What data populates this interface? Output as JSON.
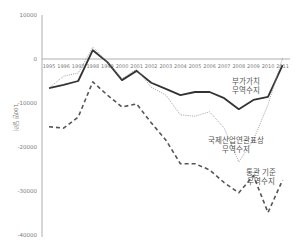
{
  "chart_data": {
    "type": "line",
    "title": "",
    "xlabel": "",
    "ylabel": "100만 달러",
    "ylim": [
      -40000,
      10000
    ],
    "yticks": [
      10000,
      0,
      -10000,
      -20000,
      -30000,
      -40000
    ],
    "ytick_labels": [
      "10000",
      "0",
      "-10000",
      "-20000",
      "-30000",
      "-40000"
    ],
    "grid": false,
    "legend_position": "inline-annotations",
    "categories": [
      "1995",
      "1996",
      "1997",
      "1998",
      "1999",
      "2000",
      "2001",
      "2002",
      "2003",
      "2004",
      "2005",
      "2006",
      "2007",
      "2008",
      "2009",
      "2010",
      "2011"
    ],
    "series": [
      {
        "name": "부가가치 무역수지",
        "label_lines": [
          "부가가치",
          "무역수지"
        ],
        "style": "solid",
        "color": "#333333",
        "values": [
          -6600,
          -5900,
          -5000,
          2000,
          -700,
          -4800,
          -2700,
          -5400,
          -6800,
          -8200,
          -7500,
          -7500,
          -8900,
          -11400,
          -9300,
          -8600,
          -1400
        ]
      },
      {
        "name": "국제산업연관표상 무역수지",
        "label_lines": [
          "국제산업연관표상",
          "무역수지"
        ],
        "style": "dotted",
        "color": "#888888",
        "values": [
          -6600,
          -3900,
          -3200,
          2700,
          -700,
          -4500,
          -2300,
          -6400,
          -8200,
          -12700,
          -13000,
          -12000,
          -15700,
          -23400,
          -18400,
          -10400,
          200
        ]
      },
      {
        "name": "통관 기준 무역수지",
        "label_lines": [
          "통관 기준",
          "무역수지"
        ],
        "style": "dashed",
        "color": "#555555",
        "values": [
          -15400,
          -15700,
          -13200,
          -5200,
          -8200,
          -10900,
          -10200,
          -14500,
          -18400,
          -23800,
          -23800,
          -25200,
          -28100,
          -30400,
          -26500,
          -34900,
          -27500
        ]
      }
    ]
  }
}
